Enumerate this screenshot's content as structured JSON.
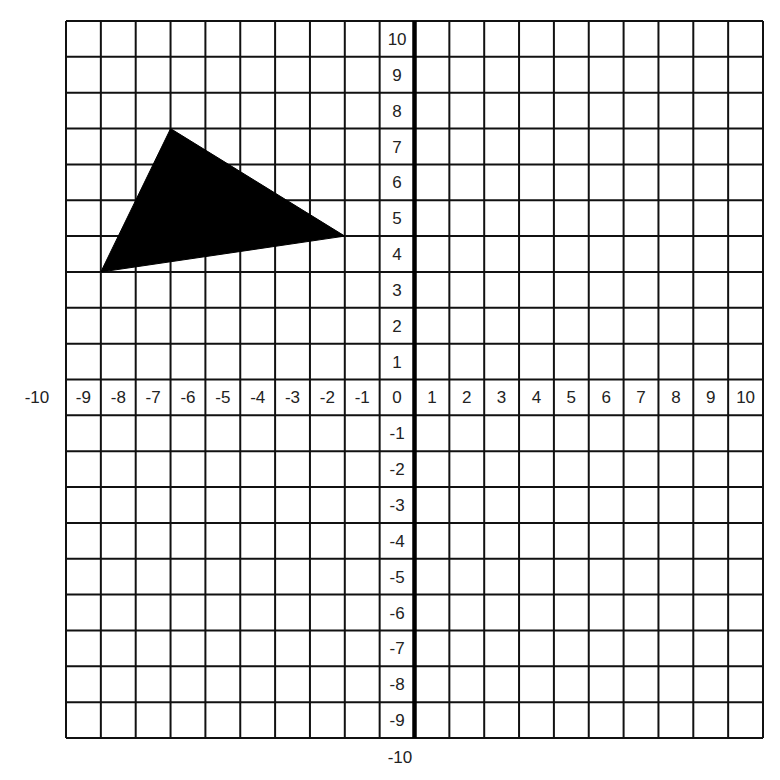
{
  "chart_data": {
    "type": "scatter",
    "title": "",
    "xlabel": "",
    "ylabel": "",
    "xlim": [
      -10,
      10
    ],
    "ylim": [
      -10,
      10
    ],
    "grid": true,
    "x_tick_labels": [
      "-10",
      "-9",
      "-8",
      "-7",
      "-6",
      "-5",
      "-4",
      "-3",
      "-2",
      "-1",
      "0",
      "1",
      "2",
      "3",
      "4",
      "5",
      "6",
      "7",
      "8",
      "9",
      "10"
    ],
    "y_tick_labels": [
      "10",
      "9",
      "8",
      "7",
      "6",
      "5",
      "4",
      "3",
      "2",
      "1",
      "0",
      "-1",
      "-2",
      "-3",
      "-4",
      "-5",
      "-6",
      "-7",
      "-8",
      "-9",
      "-10"
    ],
    "shapes": [
      {
        "name": "triangle",
        "fill": "#000000",
        "vertices": [
          [
            -7,
            7
          ],
          [
            -9,
            3
          ],
          [
            -2,
            4
          ]
        ]
      }
    ]
  },
  "grid": {
    "left": 66,
    "top": 21,
    "width": 697,
    "height": 717,
    "columns": 20,
    "rows": 20,
    "line_color": "#111111",
    "axis_color": "#000000"
  },
  "labels": {
    "x_outside_left": "-10",
    "y_outside_bottom": "-10"
  }
}
